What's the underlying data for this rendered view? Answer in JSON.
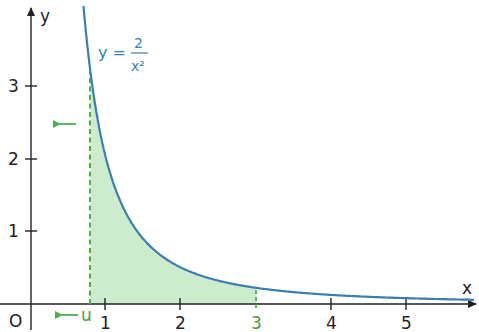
{
  "chart_data": {
    "type": "area",
    "title": "",
    "function_label": {
      "lhs": "y =",
      "numerator": "2",
      "denominator": "x²"
    },
    "function": "y = 2/x^2",
    "xlabel": "x",
    "ylabel": "y",
    "origin_label": "O",
    "x_ticks": [
      "1",
      "2",
      "3",
      "4",
      "5"
    ],
    "y_ticks": [
      "1",
      "2",
      "3"
    ],
    "xlim": [
      -0.4,
      5.8
    ],
    "ylim": [
      -0.35,
      4.1
    ],
    "shaded_region": {
      "from": "u",
      "to": 3,
      "u_value": 0.79,
      "color": "#cdeccd"
    },
    "markers": {
      "u_label": "u",
      "highlight_tick": "3"
    },
    "annotations": [
      "arrow left near u on x-axis",
      "arrow left at height ~2.3 indicating u decreasing"
    ],
    "colors": {
      "curve": "#3a7fb0",
      "fill": "#cdeccd",
      "dashed": "#4caf50",
      "accent_text": "#4a9a4a",
      "axis": "#222222"
    }
  }
}
